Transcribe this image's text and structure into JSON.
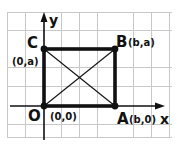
{
  "diagram": {
    "type": "coordinate-rectangle",
    "grid": {
      "color": "#c8c8c8",
      "x0": 7,
      "y0": 12,
      "x1": 172,
      "y1": 138,
      "cell": 18
    },
    "axes": {
      "x_label": "x",
      "y_label": "y",
      "origin_px": [
        44,
        106
      ],
      "x_end_px": 162,
      "y_end_px": 14
    },
    "points": [
      {
        "id": "O",
        "letter": "O",
        "coords": "(0,0)",
        "px": [
          44,
          106
        ]
      },
      {
        "id": "A",
        "letter": "A",
        "coords": "(b,0)",
        "px": [
          115,
          106
        ]
      },
      {
        "id": "B",
        "letter": "B",
        "coords": "(b,a)",
        "px": [
          115,
          49
        ]
      },
      {
        "id": "C",
        "letter": "C",
        "coords": "(0,a)",
        "px": [
          44,
          49
        ]
      }
    ],
    "edges": [
      [
        "O",
        "A"
      ],
      [
        "A",
        "B"
      ],
      [
        "B",
        "C"
      ],
      [
        "C",
        "O"
      ]
    ],
    "diagonals": [
      [
        "O",
        "B"
      ],
      [
        "A",
        "C"
      ]
    ],
    "colors": {
      "line": "#111111",
      "grid": "#c8c8c8",
      "background": "#ffffff"
    }
  }
}
